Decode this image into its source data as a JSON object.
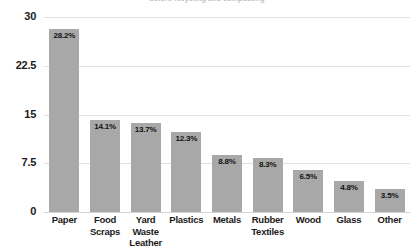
{
  "chart_data": {
    "type": "bar",
    "title": "before recycling and composting",
    "title_clipped": true,
    "xlabel": "",
    "ylabel": "",
    "ylim": [
      0,
      30
    ],
    "yticks": [
      "0",
      "7.5",
      "15",
      "22.5",
      "30"
    ],
    "grid": true,
    "legend": "none",
    "bar_color": "#a8a8a8",
    "categories": [
      "Paper",
      "Food Scraps",
      "Yard Waste Leather",
      "Plastics",
      "Metals",
      "Rubber Textiles",
      "Wood",
      "Glass",
      "Other"
    ],
    "category_lines": [
      [
        "Paper"
      ],
      [
        "Food",
        "Scraps"
      ],
      [
        "Yard Waste",
        "Leather"
      ],
      [
        "Plastics"
      ],
      [
        "Metals"
      ],
      [
        "Rubber",
        "Textiles"
      ],
      [
        "Wood"
      ],
      [
        "Glass"
      ],
      [
        "Other"
      ]
    ],
    "values": [
      28.2,
      14.1,
      13.7,
      12.3,
      8.8,
      8.3,
      6.5,
      4.8,
      3.5
    ],
    "value_labels": [
      "28.2%",
      "14.1%",
      "13.7%",
      "12.3%",
      "8.8%",
      "8.3%",
      "6.5%",
      "4.8%",
      "3.5%"
    ]
  }
}
